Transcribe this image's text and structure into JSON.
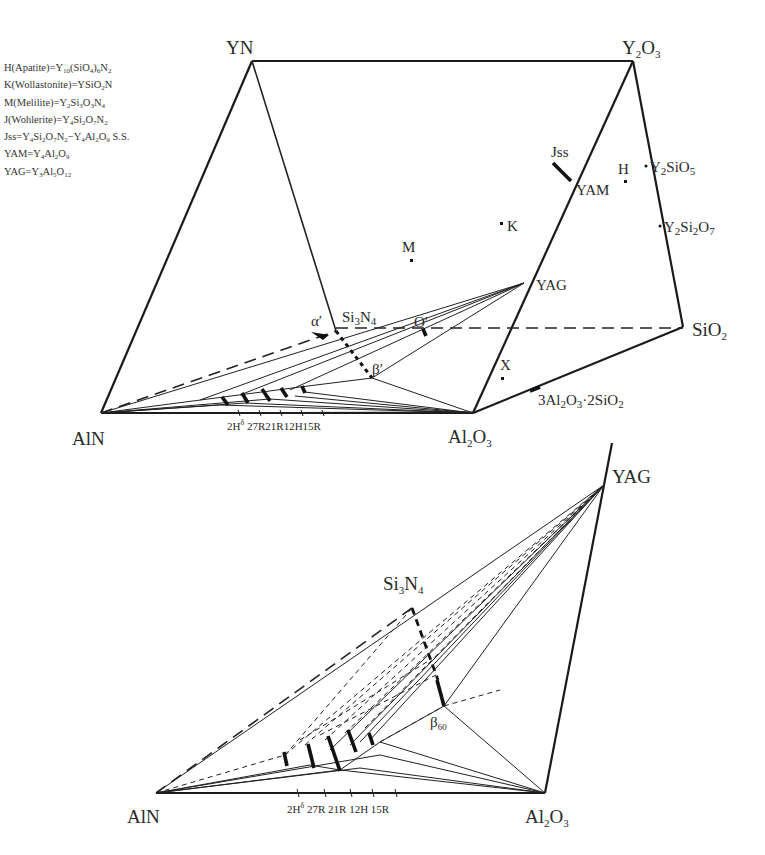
{
  "legend": [
    {
      "key": "H",
      "name": "Apatite",
      "formula": "Y10(SiO4)6N2"
    },
    {
      "key": "K",
      "name": "Wollastonite",
      "formula": "YSiO2N"
    },
    {
      "key": "M",
      "name": "Melilite",
      "formula": "Y2Si3O3N4"
    },
    {
      "key": "J",
      "name": "Wohlerite",
      "formula": "Y4Si2O7N2"
    },
    {
      "key": "Jss",
      "name": "",
      "formula": "Y4Si2O7N2 - Y4Al2O9 S.S."
    },
    {
      "key": "YAM",
      "name": "",
      "formula": "Y4Al2O9"
    },
    {
      "key": "YAG",
      "name": "",
      "formula": "Y3Al5O12"
    }
  ],
  "legend_lines": {
    "l0a": "H(Apatite)=Y",
    "l0b": "10",
    "l0c": "(SiO",
    "l0d": "4",
    "l0e": ")",
    "l0f": "6",
    "l0g": "N",
    "l0h": "2",
    "l1a": "K(Wollastonite)=YSiO",
    "l1b": "2",
    "l1c": "N",
    "l2a": "M(Melilite)=Y",
    "l2b": "2",
    "l2c": "Si",
    "l2d": "3",
    "l2e": "O",
    "l2f": "3",
    "l2g": "N",
    "l2h": "4",
    "l3a": "J(Wohlerite)=Y",
    "l3b": "4",
    "l3c": "Si",
    "l3d": "2",
    "l3e": "O",
    "l3f": "7",
    "l3g": "N",
    "l3h": "2",
    "l4a": "Jss=Y",
    "l4b": "4",
    "l4c": "Si",
    "l4d": "2",
    "l4e": "O",
    "l4f": "7",
    "l4g": "N",
    "l4h": "2",
    "l4i": "−Y",
    "l4j": "4",
    "l4k": "Al",
    "l4l": "2",
    "l4m": "O",
    "l4n": "9",
    "l4o": " S.S.",
    "l5a": "YAM=Y",
    "l5b": "4",
    "l5c": "Al",
    "l5d": "2",
    "l5e": "O",
    "l5f": "9",
    "l6a": "YAG=Y",
    "l6b": "3",
    "l6c": "Al",
    "l6d": "5",
    "l6e": "O",
    "l6f": "12"
  },
  "upper_diagram": {
    "vertices": {
      "YN": "YN",
      "Y2O3_a": "Y",
      "Y2O3_b": "2",
      "Y2O3_c": "O",
      "Y2O3_d": "3",
      "AlN": "AlN",
      "Al2O3_a": "Al",
      "Al2O3_b": "2",
      "Al2O3_c": "O",
      "Al2O3_d": "3",
      "SiO2_a": "SiO",
      "SiO2_b": "2",
      "Si3N4_a": "Si",
      "Si3N4_b": "3",
      "Si3N4_c": "N",
      "Si3N4_d": "4"
    },
    "points": {
      "Jss": "Jss",
      "YAM": "YAM",
      "H": "H",
      "K": "K",
      "M": "M",
      "YAG": "YAG",
      "X": "X",
      "alpha": "α′",
      "O_prime": "O′",
      "beta": "β′",
      "Y2SiO5_a": "Y",
      "Y2SiO5_b": "2",
      "Y2SiO5_c": "SiO",
      "Y2SiO5_d": "5",
      "Y2Si2O7_a": "Y",
      "Y2Si2O7_b": "2",
      "Y2Si2O7_c": "Si",
      "Y2Si2O7_d": "2",
      "Y2Si2O7_e": "O",
      "Y2Si2O7_f": "7",
      "mullite_a": "3Al",
      "mullite_b": "2",
      "mullite_c": "O",
      "mullite_d": "3",
      "mullite_e": "·2SiO",
      "mullite_f": "2"
    },
    "polytypes": {
      "a": "2H",
      "b": "δ",
      "c": " 27R21R12H15R"
    }
  },
  "lower_diagram": {
    "vertices": {
      "YAG": "YAG",
      "AlN": "AlN",
      "Al2O3_a": "Al",
      "Al2O3_b": "2",
      "Al2O3_c": "O",
      "Al2O3_d": "3",
      "Si3N4_a": "Si",
      "Si3N4_b": "3",
      "Si3N4_c": "N",
      "Si3N4_d": "4"
    },
    "points": {
      "beta_a": "β",
      "beta_b": "60"
    },
    "polytypes": {
      "a": "2H",
      "b": "δ",
      "c": " 27R 21R 12H 15R"
    }
  }
}
